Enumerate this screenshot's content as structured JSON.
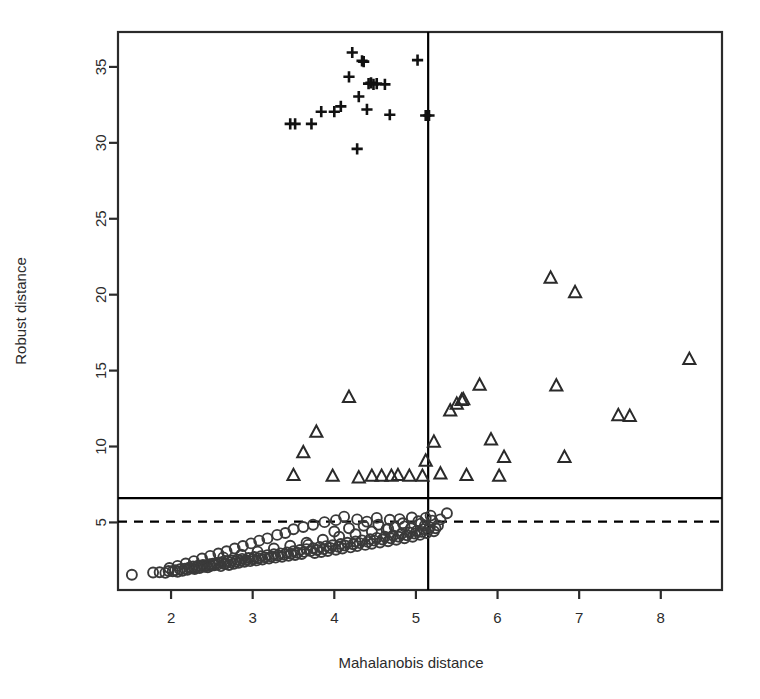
{
  "chart_data": {
    "type": "scatter",
    "title": "",
    "xlabel": "Mahalanobis distance",
    "ylabel": "Robust distance",
    "xlim": [
      1.35,
      8.75
    ],
    "ylim": [
      0.55,
      37.3
    ],
    "xticks": [
      2,
      3,
      4,
      5,
      6,
      7,
      8
    ],
    "yticks": [
      5,
      10,
      15,
      20,
      25,
      30,
      35
    ],
    "grid": false,
    "legend": "none",
    "annotations": {
      "vertical_cutoff_line": {
        "x": 5.15,
        "style": "solid",
        "color": "#000000"
      },
      "horizontal_cutoff_line": {
        "y": 6.6,
        "style": "solid",
        "color": "#000000"
      },
      "horizontal_threshold_line": {
        "y": 5.05,
        "style": "dashed",
        "color": "#000000"
      }
    },
    "series": [
      {
        "name": "regular observations",
        "marker": "circle",
        "color": "#3a3a3a",
        "points": [
          [
            1.52,
            1.55
          ],
          [
            1.78,
            1.7
          ],
          [
            1.86,
            1.72
          ],
          [
            1.93,
            1.68
          ],
          [
            1.97,
            1.8
          ],
          [
            2.02,
            1.78
          ],
          [
            2.05,
            1.85
          ],
          [
            2.08,
            1.75
          ],
          [
            2.11,
            1.92
          ],
          [
            2.14,
            1.82
          ],
          [
            2.17,
            1.95
          ],
          [
            2.2,
            1.88
          ],
          [
            2.22,
            2.02
          ],
          [
            2.25,
            1.98
          ],
          [
            2.27,
            2.1
          ],
          [
            2.29,
            1.93
          ],
          [
            2.31,
            2.05
          ],
          [
            2.33,
            2.15
          ],
          [
            2.35,
            2.0
          ],
          [
            2.37,
            2.12
          ],
          [
            2.39,
            2.2
          ],
          [
            2.41,
            2.08
          ],
          [
            2.43,
            2.18
          ],
          [
            2.45,
            2.05
          ],
          [
            2.47,
            2.25
          ],
          [
            2.49,
            2.14
          ],
          [
            2.51,
            2.28
          ],
          [
            2.53,
            2.18
          ],
          [
            2.55,
            2.32
          ],
          [
            2.57,
            2.22
          ],
          [
            2.59,
            2.35
          ],
          [
            2.61,
            2.12
          ],
          [
            2.63,
            2.4
          ],
          [
            2.65,
            2.26
          ],
          [
            2.67,
            2.3
          ],
          [
            2.69,
            2.45
          ],
          [
            2.71,
            2.2
          ],
          [
            2.73,
            2.38
          ],
          [
            2.75,
            2.5
          ],
          [
            2.77,
            2.28
          ],
          [
            2.79,
            2.42
          ],
          [
            2.81,
            2.55
          ],
          [
            2.83,
            2.34
          ],
          [
            2.85,
            2.48
          ],
          [
            2.87,
            2.6
          ],
          [
            2.9,
            2.4
          ],
          [
            2.92,
            2.52
          ],
          [
            2.95,
            2.66
          ],
          [
            2.97,
            2.45
          ],
          [
            3.0,
            2.58
          ],
          [
            3.02,
            2.72
          ],
          [
            3.05,
            2.5
          ],
          [
            3.07,
            2.64
          ],
          [
            3.1,
            2.78
          ],
          [
            3.12,
            2.56
          ],
          [
            3.15,
            2.7
          ],
          [
            3.18,
            2.85
          ],
          [
            3.2,
            2.62
          ],
          [
            3.23,
            2.76
          ],
          [
            3.26,
            2.9
          ],
          [
            3.28,
            2.68
          ],
          [
            3.31,
            2.82
          ],
          [
            3.34,
            2.96
          ],
          [
            3.36,
            2.74
          ],
          [
            3.39,
            2.88
          ],
          [
            3.42,
            3.02
          ],
          [
            3.44,
            2.8
          ],
          [
            3.47,
            2.94
          ],
          [
            3.5,
            3.1
          ],
          [
            3.52,
            2.86
          ],
          [
            3.55,
            3.0
          ],
          [
            3.58,
            3.18
          ],
          [
            3.6,
            2.92
          ],
          [
            3.63,
            3.06
          ],
          [
            3.66,
            3.24
          ],
          [
            3.68,
            3.52
          ],
          [
            3.71,
            3.12
          ],
          [
            3.74,
            3.3
          ],
          [
            3.76,
            2.99
          ],
          [
            3.79,
            3.18
          ],
          [
            3.82,
            3.38
          ],
          [
            3.84,
            3.05
          ],
          [
            3.87,
            3.24
          ],
          [
            3.9,
            3.44
          ],
          [
            3.92,
            3.12
          ],
          [
            3.95,
            3.32
          ],
          [
            3.98,
            3.5
          ],
          [
            4.0,
            4.4
          ],
          [
            4.02,
            3.2
          ],
          [
            4.05,
            3.4
          ],
          [
            4.08,
            3.58
          ],
          [
            4.1,
            3.28
          ],
          [
            4.13,
            3.48
          ],
          [
            4.16,
            3.66
          ],
          [
            4.18,
            4.62
          ],
          [
            4.2,
            3.36
          ],
          [
            4.23,
            3.56
          ],
          [
            4.26,
            3.74
          ],
          [
            4.28,
            3.44
          ],
          [
            4.31,
            3.64
          ],
          [
            4.34,
            3.82
          ],
          [
            4.36,
            4.78
          ],
          [
            4.38,
            3.52
          ],
          [
            4.41,
            3.72
          ],
          [
            4.44,
            3.9
          ],
          [
            4.46,
            3.6
          ],
          [
            4.49,
            3.8
          ],
          [
            4.52,
            3.98
          ],
          [
            4.54,
            4.85
          ],
          [
            4.56,
            3.68
          ],
          [
            4.59,
            3.88
          ],
          [
            4.62,
            4.06
          ],
          [
            4.64,
            4.55
          ],
          [
            4.66,
            3.76
          ],
          [
            4.69,
            3.96
          ],
          [
            4.72,
            4.14
          ],
          [
            4.74,
            4.7
          ],
          [
            4.76,
            3.86
          ],
          [
            4.79,
            4.06
          ],
          [
            4.82,
            4.24
          ],
          [
            4.84,
            4.95
          ],
          [
            4.86,
            3.96
          ],
          [
            4.89,
            4.16
          ],
          [
            4.92,
            4.34
          ],
          [
            4.94,
            4.62
          ],
          [
            4.96,
            4.06
          ],
          [
            4.99,
            4.26
          ],
          [
            5.01,
            4.44
          ],
          [
            5.03,
            5.08
          ],
          [
            5.05,
            4.18
          ],
          [
            5.07,
            4.38
          ],
          [
            5.09,
            4.56
          ],
          [
            5.11,
            4.8
          ],
          [
            5.13,
            4.3
          ],
          [
            5.15,
            4.5
          ],
          [
            5.17,
            4.68
          ],
          [
            5.2,
            5.12
          ],
          [
            5.22,
            4.42
          ],
          [
            5.24,
            4.62
          ],
          [
            5.27,
            4.8
          ],
          [
            5.3,
            5.2
          ],
          [
            5.18,
            5.45
          ],
          [
            5.12,
            5.3
          ],
          [
            4.95,
            5.32
          ],
          [
            4.8,
            5.22
          ],
          [
            4.68,
            5.18
          ],
          [
            4.52,
            5.3
          ],
          [
            4.4,
            5.05
          ],
          [
            4.28,
            5.2
          ],
          [
            4.12,
            5.38
          ],
          [
            4.02,
            5.15
          ],
          [
            3.88,
            5.02
          ],
          [
            3.74,
            4.85
          ],
          [
            3.62,
            4.7
          ],
          [
            3.5,
            4.55
          ],
          [
            3.4,
            4.3
          ],
          [
            3.3,
            4.18
          ],
          [
            3.18,
            3.95
          ],
          [
            3.08,
            3.8
          ],
          [
            2.98,
            3.62
          ],
          [
            2.88,
            3.45
          ],
          [
            2.78,
            3.28
          ],
          [
            2.68,
            3.1
          ],
          [
            2.58,
            2.95
          ],
          [
            2.48,
            2.8
          ],
          [
            2.38,
            2.62
          ],
          [
            2.28,
            2.45
          ],
          [
            2.18,
            2.3
          ],
          [
            2.08,
            2.14
          ],
          [
            1.98,
            2.0
          ],
          [
            5.38,
            5.6
          ],
          [
            2.64,
            2.7
          ],
          [
            2.86,
            2.88
          ],
          [
            3.06,
            3.08
          ],
          [
            3.26,
            3.28
          ],
          [
            3.46,
            3.46
          ],
          [
            3.66,
            3.66
          ],
          [
            3.86,
            3.86
          ],
          [
            4.06,
            4.06
          ],
          [
            4.26,
            4.22
          ],
          [
            4.46,
            4.4
          ],
          [
            4.66,
            4.58
          ],
          [
            4.86,
            4.74
          ],
          [
            5.06,
            4.92
          ]
        ]
      },
      {
        "name": "moderate outliers",
        "marker": "triangle",
        "color": "#2a2a2a",
        "points": [
          [
            3.5,
            8.1
          ],
          [
            3.62,
            9.6
          ],
          [
            3.78,
            10.95
          ],
          [
            3.98,
            8.05
          ],
          [
            4.18,
            13.25
          ],
          [
            4.3,
            7.95
          ],
          [
            4.46,
            8.05
          ],
          [
            4.58,
            8.05
          ],
          [
            4.7,
            8.05
          ],
          [
            4.78,
            8.1
          ],
          [
            4.92,
            8.05
          ],
          [
            5.08,
            8.05
          ],
          [
            5.12,
            9.05
          ],
          [
            5.22,
            10.3
          ],
          [
            5.3,
            8.2
          ],
          [
            5.42,
            12.35
          ],
          [
            5.5,
            12.8
          ],
          [
            5.56,
            13.05
          ],
          [
            5.58,
            13.1
          ],
          [
            5.62,
            8.1
          ],
          [
            5.78,
            14.05
          ],
          [
            5.92,
            10.45
          ],
          [
            6.02,
            8.05
          ],
          [
            6.08,
            9.3
          ],
          [
            6.65,
            21.1
          ],
          [
            6.72,
            14.0
          ],
          [
            6.95,
            20.15
          ],
          [
            6.82,
            9.3
          ],
          [
            7.48,
            12.05
          ],
          [
            7.62,
            12.0
          ],
          [
            8.35,
            15.75
          ]
        ]
      },
      {
        "name": "extreme outliers",
        "marker": "plus",
        "color": "#111111",
        "points": [
          [
            3.46,
            31.25
          ],
          [
            3.52,
            31.25
          ],
          [
            3.72,
            31.25
          ],
          [
            3.84,
            32.05
          ],
          [
            4.0,
            32.05
          ],
          [
            4.08,
            32.4
          ],
          [
            4.18,
            34.35
          ],
          [
            4.22,
            35.95
          ],
          [
            4.3,
            33.05
          ],
          [
            4.34,
            35.4
          ],
          [
            4.36,
            35.35
          ],
          [
            4.28,
            29.6
          ],
          [
            4.4,
            32.2
          ],
          [
            4.42,
            33.9
          ],
          [
            4.45,
            33.95
          ],
          [
            4.48,
            33.85
          ],
          [
            4.52,
            33.9
          ],
          [
            4.62,
            33.85
          ],
          [
            4.68,
            31.85
          ],
          [
            5.02,
            35.45
          ],
          [
            5.12,
            31.8
          ],
          [
            5.16,
            31.8
          ]
        ]
      }
    ]
  },
  "axes": {
    "x_tick_labels": [
      "2",
      "3",
      "4",
      "5",
      "6",
      "7",
      "8"
    ],
    "y_tick_labels": [
      "5",
      "10",
      "15",
      "20",
      "25",
      "30",
      "35"
    ],
    "x_axis_title": "Mahalanobis distance",
    "y_axis_title": "Robust distance"
  }
}
